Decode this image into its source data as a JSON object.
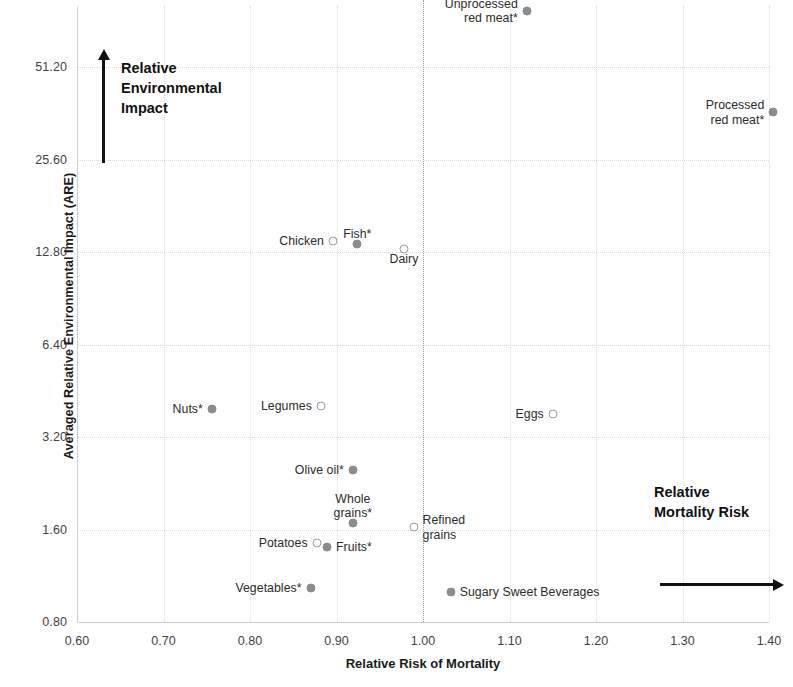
{
  "chart_data": {
    "type": "scatter",
    "title": "",
    "xlabel": "Relative Risk of Mortality",
    "ylabel": "Averaged Relative Environmental  Impact (ARE)",
    "xlim": [
      0.6,
      1.4
    ],
    "ylim": [
      0.8,
      64.0
    ],
    "yscale": "log2",
    "xticks": [
      "0.60",
      "0.70",
      "0.80",
      "0.90",
      "1.00",
      "1.10",
      "1.20",
      "1.30",
      "1.40"
    ],
    "xtick_values": [
      0.6,
      0.7,
      0.8,
      0.9,
      1.0,
      1.1,
      1.2,
      1.3,
      1.4
    ],
    "yticks": [
      "0.80",
      "1.60",
      "3.20",
      "6.40",
      "12.80",
      "25.60",
      "51.20"
    ],
    "ytick_values": [
      0.8,
      1.6,
      3.2,
      6.4,
      12.8,
      25.6,
      51.2
    ],
    "grid": true,
    "legend": "none",
    "reference_line_x": 1.0,
    "marker_styles": {
      "filled": "significant association (asterisk)",
      "open": "non-significant association"
    },
    "colors": {
      "marker_fill": "#8c8c8c",
      "marker_open_stroke": "#9b9b9b",
      "gridline": "#d9d9d9",
      "reference_line": "#9a9a9a",
      "text": "#2b2b2b",
      "annotation": "#111111"
    },
    "points": [
      {
        "label": "Unprocessed\nred meat*",
        "x": 1.12,
        "y": 78.0,
        "marker": "filled",
        "label_pos": "left"
      },
      {
        "label": "Processed\nred meat*",
        "x": 1.405,
        "y": 36.5,
        "marker": "filled",
        "label_pos": "left"
      },
      {
        "label": "Chicken",
        "x": 0.896,
        "y": 13.9,
        "marker": "open",
        "label_pos": "left"
      },
      {
        "label": "Fish*",
        "x": 0.924,
        "y": 13.6,
        "marker": "filled",
        "label_pos": "above"
      },
      {
        "label": "Dairy",
        "x": 0.978,
        "y": 13.1,
        "marker": "open",
        "label_pos": "below"
      },
      {
        "label": "Nuts*",
        "x": 0.756,
        "y": 3.95,
        "marker": "filled",
        "label_pos": "left"
      },
      {
        "label": "Legumes",
        "x": 0.882,
        "y": 4.05,
        "marker": "open",
        "label_pos": "left"
      },
      {
        "label": "Eggs",
        "x": 1.15,
        "y": 3.8,
        "marker": "open",
        "label_pos": "left"
      },
      {
        "label": "Olive oil*",
        "x": 0.919,
        "y": 2.5,
        "marker": "filled",
        "label_pos": "left"
      },
      {
        "label": "Whole\ngrains*",
        "x": 0.919,
        "y": 1.68,
        "marker": "filled",
        "label_pos": "above"
      },
      {
        "label": "Refined\ngrains",
        "x": 0.989,
        "y": 1.63,
        "marker": "open",
        "label_pos": "right"
      },
      {
        "label": "Potatoes",
        "x": 0.877,
        "y": 1.45,
        "marker": "open",
        "label_pos": "left"
      },
      {
        "label": "Fruits*",
        "x": 0.889,
        "y": 1.4,
        "marker": "filled",
        "label_pos": "right"
      },
      {
        "label": "Vegetables*",
        "x": 0.87,
        "y": 1.03,
        "marker": "filled",
        "label_pos": "left"
      },
      {
        "label": "Sugary Sweet Beverages",
        "x": 1.032,
        "y": 1.0,
        "marker": "filled",
        "label_pos": "right"
      }
    ],
    "annotations": [
      {
        "name": "vertical-arrow-annotation",
        "text": "Relative\nEnvironmental\nImpact"
      },
      {
        "name": "horizontal-arrow-annotation",
        "text": "Relative\nMortality Risk"
      }
    ]
  }
}
